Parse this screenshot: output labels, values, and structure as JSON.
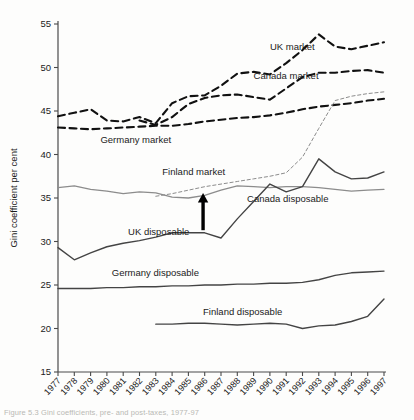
{
  "chart_data": {
    "type": "line",
    "title": "",
    "xlabel": "",
    "ylabel": "Gini coefficient per cent",
    "xlim": [
      1977,
      1997
    ],
    "ylim": [
      15,
      55
    ],
    "yticks": [
      15,
      20,
      25,
      30,
      35,
      40,
      45,
      50,
      55
    ],
    "grid": false,
    "legend_position": "inline-labels",
    "x": [
      1977,
      1978,
      1979,
      1980,
      1981,
      1982,
      1983,
      1984,
      1985,
      1986,
      1987,
      1988,
      1989,
      1990,
      1991,
      1992,
      1993,
      1994,
      1995,
      1996,
      1997
    ],
    "series": [
      {
        "name": "UK market",
        "label": "UK market",
        "style": "dashed",
        "color": "#111111",
        "width": 2.1,
        "label_x": 1990.0,
        "label_y": 52.4,
        "values": [
          44.4,
          44.8,
          45.2,
          43.9,
          43.8,
          44.3,
          43.6,
          45.9,
          46.7,
          46.8,
          47.9,
          49.3,
          49.5,
          49.2,
          50.5,
          52.0,
          53.8,
          52.4,
          52.1,
          52.5,
          52.9
        ]
      },
      {
        "name": "Canada market",
        "label": "Canada market",
        "style": "dashed",
        "color": "#111111",
        "width": 2.1,
        "label_x": 1989.0,
        "label_y": 49.1,
        "values": [
          null,
          null,
          null,
          null,
          null,
          43.9,
          43.4,
          44.3,
          45.8,
          46.5,
          46.8,
          46.9,
          46.6,
          46.3,
          47.6,
          48.9,
          49.4,
          49.4,
          49.6,
          49.7,
          49.4
        ]
      },
      {
        "name": "Germany market",
        "label": "Germany market",
        "style": "dashed",
        "color": "#111111",
        "width": 2.1,
        "label_x": 1979.6,
        "label_y": 41.7,
        "values": [
          43.1,
          43.0,
          42.9,
          43.0,
          43.1,
          43.2,
          43.3,
          43.3,
          43.5,
          43.8,
          44.0,
          44.2,
          44.3,
          44.5,
          44.8,
          45.2,
          45.5,
          45.7,
          45.9,
          46.2,
          46.4
        ]
      },
      {
        "name": "Finland market",
        "label": "Finland market",
        "style": "thin-dashed",
        "color": "#8c8c8c",
        "width": 1.0,
        "label_x": 1983.4,
        "label_y": 38.0,
        "values": [
          null,
          null,
          null,
          null,
          null,
          null,
          35.2,
          35.5,
          35.9,
          36.3,
          36.6,
          36.9,
          37.2,
          37.5,
          37.9,
          39.7,
          43.0,
          46.2,
          46.7,
          47.0,
          47.2
        ]
      },
      {
        "name": "Canada disposable",
        "label": "Canada disposable",
        "style": "solid",
        "color": "#8c8c8c",
        "width": 1.3,
        "label_x": 1988.6,
        "label_y": 35.0,
        "values": [
          36.2,
          36.4,
          36.0,
          35.8,
          35.5,
          35.7,
          35.6,
          35.1,
          35.0,
          35.3,
          35.9,
          36.4,
          36.3,
          36.2,
          36.3,
          36.3,
          36.2,
          36.0,
          35.8,
          35.9,
          36.0
        ]
      },
      {
        "name": "UK disposable",
        "label": "UK disposable",
        "style": "solid",
        "color": "#444444",
        "width": 1.4,
        "label_x": 1981.3,
        "label_y": 31.1,
        "values": [
          29.3,
          27.9,
          28.7,
          29.4,
          29.8,
          30.1,
          30.5,
          31.0,
          31.0,
          31.0,
          30.4,
          32.6,
          34.6,
          36.6,
          35.7,
          36.3,
          39.5,
          38.0,
          37.2,
          37.3,
          38.0
        ]
      },
      {
        "name": "Germany disposable",
        "label": "Germany disposable",
        "style": "solid",
        "color": "#444444",
        "width": 1.4,
        "label_x": 1980.3,
        "label_y": 26.4,
        "values": [
          24.6,
          24.6,
          24.6,
          24.7,
          24.7,
          24.8,
          24.8,
          24.9,
          24.9,
          25.0,
          25.0,
          25.1,
          25.1,
          25.2,
          25.2,
          25.3,
          25.6,
          26.1,
          26.4,
          26.5,
          26.6
        ]
      },
      {
        "name": "Finland disposable",
        "label": "Finland disposable",
        "style": "solid",
        "color": "#444444",
        "width": 1.4,
        "label_x": 1985.9,
        "label_y": 21.9,
        "values": [
          null,
          null,
          null,
          null,
          null,
          null,
          20.5,
          20.5,
          20.6,
          20.6,
          20.5,
          20.4,
          20.5,
          20.6,
          20.5,
          20.0,
          20.3,
          20.4,
          20.8,
          21.4,
          23.4
        ]
      }
    ],
    "annotations": [
      {
        "type": "arrow-up",
        "name": "uk-disposable-rise-arrow",
        "x": 1985.9,
        "y_from": 31.3,
        "y_to": 35.4,
        "color": "#000000"
      }
    ]
  },
  "figure": {
    "caption": "Figure 5.3  Gini coefficients, pre- and post-taxes, 1977-97"
  }
}
